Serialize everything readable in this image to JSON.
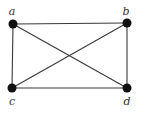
{
  "diagram": {
    "type": "graph",
    "name": "K4",
    "vertices": [
      {
        "id": "a",
        "label": "a",
        "x": 13,
        "y": 24,
        "lx": 12,
        "ly": 15
      },
      {
        "id": "b",
        "label": "b",
        "x": 127,
        "y": 23,
        "lx": 126,
        "ly": 15
      },
      {
        "id": "c",
        "label": "c",
        "x": 12,
        "y": 88,
        "lx": 12,
        "ly": 105
      },
      {
        "id": "d",
        "label": "d",
        "x": 127,
        "y": 88,
        "lx": 127,
        "ly": 105
      }
    ],
    "edges": [
      [
        "a",
        "b"
      ],
      [
        "a",
        "c"
      ],
      [
        "a",
        "d"
      ],
      [
        "b",
        "c"
      ],
      [
        "b",
        "d"
      ],
      [
        "c",
        "d"
      ]
    ],
    "colors": {
      "edge": "#3a3a3a",
      "vertex": "#111111",
      "label": "#333333",
      "background": "#ffffff"
    }
  }
}
